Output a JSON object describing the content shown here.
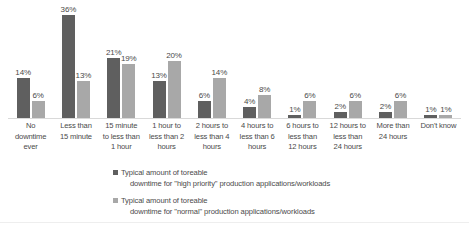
{
  "chart_data": {
    "type": "bar",
    "title": "",
    "subtitle": "",
    "xlabel": "",
    "ylabel": "",
    "ylim": [
      0,
      40
    ],
    "grid": false,
    "legend_position": "bottom",
    "data_labels": true,
    "label_suffix": "%",
    "categories": [
      "No downtime ever",
      "Less than 15 minute",
      "15 minute to less than 1 hour",
      "1 hour to less than 2 hours",
      "2 hours to less than 4 hours",
      "4 hours to less than 6 hours",
      "6 hours to less than 12 hours",
      "12 hours to less than 24 hours",
      "More than 24 hours",
      "Don't know"
    ],
    "category_lines": [
      [
        "No",
        "downtime",
        "ever"
      ],
      [
        "Less than",
        "15 minute",
        ""
      ],
      [
        "15 minute",
        "to less than",
        "1 hour"
      ],
      [
        "1 hour to",
        "less than 2",
        "hours"
      ],
      [
        "2 hours to",
        "less than 4",
        "hours"
      ],
      [
        "4 hours to",
        "less than 6",
        "hours"
      ],
      [
        "6 hours to",
        "less than",
        "12 hours"
      ],
      [
        "12 hours to",
        "less than",
        "24 hours"
      ],
      [
        "More than",
        "24 hours",
        ""
      ],
      [
        "Don't know",
        "",
        ""
      ]
    ],
    "series": [
      {
        "name": "Typical amount of tolerable downtime for \"high priority\" production applications/workloads",
        "color": "#5f5f5f",
        "values": [
          14,
          36,
          21,
          13,
          6,
          4,
          1,
          2,
          2,
          1
        ],
        "labels": [
          "14%",
          "36%",
          "21%",
          "13%",
          "6%",
          "4%",
          "1%",
          "2%",
          "2%",
          "1%"
        ]
      },
      {
        "name": "Typical amount of tolerable downtime for \"normal\" production applications/workloads",
        "color": "#a8a8a8",
        "values": [
          6,
          13,
          19,
          20,
          14,
          8,
          6,
          6,
          6,
          1
        ],
        "labels": [
          "6%",
          "13%",
          "19%",
          "20%",
          "14%",
          "8%",
          "6%",
          "6%",
          "6%",
          "1%"
        ]
      }
    ]
  },
  "legend": {
    "entries": [
      {
        "line1": "Typical amount of toreable",
        "line2": "downtime for \"high priority\" production applications/workloads",
        "color": "#5f5f5f"
      },
      {
        "line1": "Typical amount of toreable",
        "line2": "downtime for \"normal\" production applications/workloads",
        "color": "#a8a8a8"
      }
    ]
  },
  "colors": {
    "series_high_priority": "#5f5f5f",
    "series_normal": "#a8a8a8",
    "background": "#ffffff",
    "text": "#4a4a4a",
    "axis_line": "#d9d9d9"
  }
}
